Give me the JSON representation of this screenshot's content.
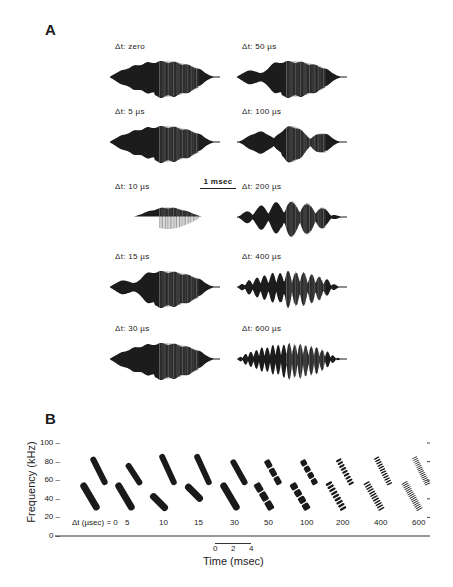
{
  "figure": {
    "panel_a": {
      "label": "A",
      "scale_bar": "1 msec",
      "waveforms": [
        {
          "label": "Δt: zero",
          "col": 0,
          "row": 0,
          "type": "single"
        },
        {
          "label": "Δt: 5 µs",
          "col": 0,
          "row": 1,
          "type": "single"
        },
        {
          "label": "Δt: 10 µs",
          "col": 0,
          "row": 2,
          "type": "narrow"
        },
        {
          "label": "Δt: 15 µs",
          "col": 0,
          "row": 3,
          "type": "dip"
        },
        {
          "label": "Δt: 30 µs",
          "col": 0,
          "row": 4,
          "type": "single"
        },
        {
          "label": "Δt: 50 µs",
          "col": 1,
          "row": 0,
          "type": "dip"
        },
        {
          "label": "Δt: 100 µs",
          "col": 1,
          "row": 1,
          "type": "lobes3"
        },
        {
          "label": "Δt: 200 µs",
          "col": 1,
          "row": 2,
          "type": "lobes7"
        },
        {
          "label": "Δt: 400 µs",
          "col": 1,
          "row": 3,
          "type": "lobes14"
        },
        {
          "label": "Δt: 600 µs",
          "col": 1,
          "row": 4,
          "type": "lobes20"
        }
      ]
    },
    "panel_b": {
      "label": "B",
      "ylabel": "Frequency (kHz)",
      "xlabel": "Time (msec)",
      "yticks": [
        "0",
        "20",
        "40",
        "60",
        "80",
        "100"
      ],
      "scale_ticks": [
        "0",
        "2",
        "4"
      ],
      "dt_prefix": "Δt (µsec) = ",
      "dt_values": [
        "0",
        "5",
        "10",
        "15",
        "30",
        "50",
        "100",
        "200",
        "400",
        "600"
      ]
    }
  },
  "chart_data": {
    "type": "scatter",
    "xlabel": "Time (msec)",
    "ylabel": "Frequency (kHz)",
    "ylim": [
      0,
      100
    ],
    "yticks": [
      0,
      20,
      40,
      60,
      80,
      100
    ],
    "categories": [
      "0",
      "5",
      "10",
      "15",
      "30",
      "50",
      "100",
      "200",
      "400",
      "600"
    ],
    "category_label": "Δt (µsec)",
    "series": [
      {
        "name": "harmonic 1 sweep (kHz start→end)",
        "values": [
          [
            57,
            28
          ],
          [
            57,
            28
          ],
          [
            45,
            28
          ],
          [
            55,
            38
          ],
          [
            57,
            28
          ],
          [
            57,
            28
          ],
          [
            57,
            28
          ],
          [
            58,
            28
          ],
          [
            58,
            28
          ],
          [
            58,
            28
          ]
        ]
      },
      {
        "name": "harmonic 2 sweep (kHz start→end)",
        "values": [
          [
            85,
            55
          ],
          [
            78,
            55
          ],
          [
            88,
            55
          ],
          [
            88,
            55
          ],
          [
            82,
            55
          ],
          [
            82,
            55
          ],
          [
            82,
            55
          ],
          [
            83,
            55
          ],
          [
            85,
            55
          ],
          [
            85,
            55
          ]
        ]
      }
    ],
    "grid": false,
    "legend": "none"
  }
}
